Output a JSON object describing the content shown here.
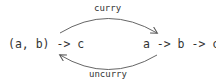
{
  "nodes": {
    "left": "(a, b) -> c",
    "right": "a -> b -> c"
  },
  "edges": {
    "top": {
      "label": "curry",
      "from": "left",
      "to": "right"
    },
    "bottom": {
      "label": "uncurry",
      "from": "right",
      "to": "left"
    }
  },
  "colors": {
    "text": "#333333",
    "arrow": "#555555"
  }
}
